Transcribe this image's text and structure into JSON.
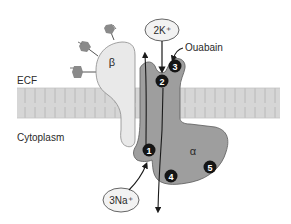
{
  "diagram": {
    "regions": {
      "extracellular": "ECF",
      "intracellular": "Cytoplasm"
    },
    "subunits": {
      "beta": "β",
      "alpha": "α"
    },
    "ions": {
      "potassium": "2K⁺",
      "sodium": "3Na⁺"
    },
    "inhibitor": "Ouabain",
    "sites": [
      "1",
      "2",
      "3",
      "4",
      "5"
    ],
    "colors": {
      "membrane": "#d6d6d6",
      "membrane_lines": "#b4b4b4",
      "beta_fill": "#e8e8e8",
      "alpha_fill": "#9c9c9c",
      "glycan_fill": "#8a8a8a",
      "site_fill": "#151515",
      "ellipse_fill": "#f2f2f2",
      "stroke": "#4a4a4a"
    }
  }
}
